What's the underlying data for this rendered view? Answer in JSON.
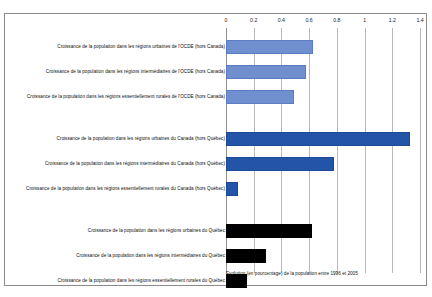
{
  "chart_data": {
    "type": "bar",
    "orientation": "horizontal",
    "title": "",
    "xlabel": "Evolution (en pourcentage) de la population entre 1996 et 2005",
    "ylabel": "",
    "xlim": [
      0,
      1.4
    ],
    "grid": true,
    "legend": "none",
    "tick_labels": [
      "0",
      "0.2",
      "0.4",
      "0.6",
      "0.8",
      "1",
      "1.2",
      "1.4"
    ],
    "tick_values": [
      0,
      0.2,
      0.4,
      0.6,
      0.8,
      1,
      1.2,
      1.4
    ],
    "groups": [
      {
        "name": "OCDE (hors Canada)",
        "color": "#6f8fce",
        "categories": [
          "Croissance de la population dans les régions urbaines de l'OCDE (hors Canada)",
          "Croissance de la population dans les régions intermédiaires de l'OCDE (hors Canada)",
          "Croissance de la population dans les régions essentiellement rurales de l'OCDE (hors Canada)"
        ],
        "values": [
          0.63,
          0.58,
          0.49
        ]
      },
      {
        "name": "Canada (hors Québec)",
        "color": "#2255a8",
        "categories": [
          "Croissance de la population dans les régions urbaines du Canada (hors Québec)",
          "Croissance de la population dans les régions intermédiaires du Canada (hors Québec)",
          "Croissance de la population dans les régions essentiellement rurales du Canada (hors Québec)"
        ],
        "values": [
          1.33,
          0.78,
          0.09
        ]
      },
      {
        "name": "Québec",
        "color": "#000000",
        "categories": [
          "Croissance de la population dans les régions urbaines du Québec",
          "Croissance de la population dans les régions intermédiaires du Québec",
          "Croissance de la population dans les régions essentiellement rurales du Québec"
        ],
        "values": [
          0.62,
          0.29,
          0.15
        ]
      }
    ]
  },
  "axis": {
    "t0": "0",
    "t1": "0.2",
    "t2": "0.4",
    "t3": "0.6",
    "t4": "0.8",
    "t5": "1",
    "t6": "1.2",
    "t7": "1.4"
  },
  "bars": {
    "b0": {
      "label": "Croissance de la population dans les régions urbaines de l'OCDE (hors Canada)",
      "value": 0.63
    },
    "b1": {
      "label": "Croissance de la population dans les régions intermédiaires de l'OCDE (hors Canada)",
      "value": 0.58
    },
    "b2": {
      "label": "Croissance de la population dans les régions essentiellement rurales de l'OCDE (hors Canada)",
      "value": 0.49
    },
    "b3": {
      "label": "Croissance de la population dans les régions urbaines du Canada (hors Québec)",
      "value": 1.33
    },
    "b4": {
      "label": "Croissance de la population dans les régions intermédiaires du Canada (hors Québec)",
      "value": 0.78
    },
    "b5": {
      "label": "Croissance de la population dans les régions essentiellement rurales du Canada (hors Québec)",
      "value": 0.09
    },
    "b6": {
      "label": "Croissance de la population dans les régions urbaines du Québec",
      "value": 0.62
    },
    "b7": {
      "label": "Croissance de la population dans les régions intermédiaires du Québec",
      "value": 0.29
    },
    "b8": {
      "label": "Croissance de la population dans les régions essentiellement rurales du Québec",
      "value": 0.15
    }
  },
  "caption": {
    "text": "Evolution (en pourcentage) de la population entre 1996 et 2005"
  }
}
